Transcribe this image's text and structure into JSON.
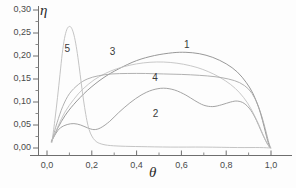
{
  "chart_data": {
    "type": "line",
    "title": "",
    "xlabel": "θ",
    "ylabel": "η",
    "xlim": [
      -0.03,
      1.08
    ],
    "ylim": [
      -0.012,
      0.315
    ],
    "grid": false,
    "legend": "inline-curve-numbers",
    "xticks": [
      0.0,
      0.2,
      0.4,
      0.6,
      0.8,
      1.0
    ],
    "xticklabels": [
      "0,0",
      "0,2",
      "0,4",
      "0,6",
      "0,8",
      "1,0"
    ],
    "xminorticks": [
      0.1,
      0.3,
      0.5,
      0.7,
      0.9
    ],
    "yticks": [
      0.0,
      0.05,
      0.1,
      0.15,
      0.2,
      0.25,
      0.3
    ],
    "yticklabels": [
      "0,00",
      "0,05",
      "0,10",
      "0,15",
      "0,20",
      "0,25",
      "0,30"
    ],
    "yminorticks": [
      0.025,
      0.075,
      0.125,
      0.175,
      0.225,
      0.275
    ],
    "series": [
      {
        "name": "1",
        "label": "1",
        "label_x": 0.625,
        "label_y": 0.222,
        "color": "#8c8c8c",
        "points": [
          [
            0.02,
            0.015
          ],
          [
            0.05,
            0.045
          ],
          [
            0.08,
            0.07
          ],
          [
            0.12,
            0.095
          ],
          [
            0.18,
            0.125
          ],
          [
            0.25,
            0.152
          ],
          [
            0.32,
            0.172
          ],
          [
            0.4,
            0.19
          ],
          [
            0.48,
            0.201
          ],
          [
            0.56,
            0.207
          ],
          [
            0.62,
            0.208
          ],
          [
            0.68,
            0.205
          ],
          [
            0.74,
            0.197
          ],
          [
            0.8,
            0.183
          ],
          [
            0.85,
            0.165
          ],
          [
            0.89,
            0.142
          ],
          [
            0.92,
            0.118
          ],
          [
            0.945,
            0.088
          ],
          [
            0.962,
            0.06
          ],
          [
            0.975,
            0.035
          ],
          [
            0.985,
            0.016
          ],
          [
            0.995,
            0.002
          ]
        ]
      },
      {
        "name": "2",
        "label": "2",
        "label_x": 0.485,
        "label_y": 0.072,
        "color": "#9a9a9a",
        "points": [
          [
            0.02,
            0.014
          ],
          [
            0.04,
            0.032
          ],
          [
            0.06,
            0.044
          ],
          [
            0.09,
            0.051
          ],
          [
            0.12,
            0.053
          ],
          [
            0.15,
            0.05
          ],
          [
            0.18,
            0.044
          ],
          [
            0.21,
            0.04
          ],
          [
            0.24,
            0.044
          ],
          [
            0.28,
            0.058
          ],
          [
            0.32,
            0.077
          ],
          [
            0.37,
            0.098
          ],
          [
            0.42,
            0.115
          ],
          [
            0.47,
            0.126
          ],
          [
            0.52,
            0.13
          ],
          [
            0.57,
            0.126
          ],
          [
            0.62,
            0.115
          ],
          [
            0.66,
            0.103
          ],
          [
            0.7,
            0.093
          ],
          [
            0.74,
            0.09
          ],
          [
            0.78,
            0.094
          ],
          [
            0.82,
            0.1
          ],
          [
            0.85,
            0.102
          ],
          [
            0.88,
            0.097
          ],
          [
            0.91,
            0.082
          ],
          [
            0.935,
            0.06
          ],
          [
            0.955,
            0.038
          ],
          [
            0.972,
            0.02
          ],
          [
            0.985,
            0.008
          ],
          [
            0.995,
            0.001
          ]
        ]
      },
      {
        "name": "3",
        "label": "3",
        "label_x": 0.293,
        "label_y": 0.207,
        "color": "#c2c2c2",
        "points": [
          [
            0.02,
            0.013
          ],
          [
            0.05,
            0.048
          ],
          [
            0.08,
            0.078
          ],
          [
            0.12,
            0.106
          ],
          [
            0.16,
            0.128
          ],
          [
            0.21,
            0.148
          ],
          [
            0.26,
            0.162
          ],
          [
            0.31,
            0.172
          ],
          [
            0.37,
            0.18
          ],
          [
            0.43,
            0.185
          ],
          [
            0.49,
            0.187
          ],
          [
            0.55,
            0.186
          ],
          [
            0.61,
            0.182
          ],
          [
            0.67,
            0.175
          ],
          [
            0.72,
            0.166
          ],
          [
            0.77,
            0.154
          ],
          [
            0.82,
            0.138
          ],
          [
            0.86,
            0.12
          ],
          [
            0.895,
            0.098
          ],
          [
            0.925,
            0.072
          ],
          [
            0.948,
            0.048
          ],
          [
            0.966,
            0.027
          ],
          [
            0.982,
            0.011
          ],
          [
            0.995,
            0.001
          ]
        ]
      },
      {
        "name": "4",
        "label": "4",
        "label_x": 0.483,
        "label_y": 0.15,
        "color": "#a8a8a8",
        "points": [
          [
            0.02,
            0.013
          ],
          [
            0.045,
            0.055
          ],
          [
            0.07,
            0.09
          ],
          [
            0.1,
            0.118
          ],
          [
            0.14,
            0.138
          ],
          [
            0.18,
            0.15
          ],
          [
            0.23,
            0.157
          ],
          [
            0.29,
            0.161
          ],
          [
            0.36,
            0.162
          ],
          [
            0.44,
            0.162
          ],
          [
            0.52,
            0.161
          ],
          [
            0.6,
            0.16
          ],
          [
            0.68,
            0.158
          ],
          [
            0.75,
            0.155
          ],
          [
            0.81,
            0.15
          ],
          [
            0.86,
            0.142
          ],
          [
            0.9,
            0.128
          ],
          [
            0.928,
            0.108
          ],
          [
            0.95,
            0.082
          ],
          [
            0.967,
            0.055
          ],
          [
            0.98,
            0.031
          ],
          [
            0.99,
            0.012
          ],
          [
            0.998,
            0.0
          ]
        ]
      },
      {
        "name": "5",
        "label": "5",
        "label_x": 0.092,
        "label_y": 0.212,
        "color": "#bdbdbd",
        "points": [
          [
            0.022,
            0.012
          ],
          [
            0.035,
            0.06
          ],
          [
            0.047,
            0.11
          ],
          [
            0.058,
            0.16
          ],
          [
            0.068,
            0.205
          ],
          [
            0.078,
            0.238
          ],
          [
            0.088,
            0.257
          ],
          [
            0.098,
            0.264
          ],
          [
            0.108,
            0.262
          ],
          [
            0.118,
            0.25
          ],
          [
            0.128,
            0.228
          ],
          [
            0.138,
            0.197
          ],
          [
            0.148,
            0.16
          ],
          [
            0.158,
            0.122
          ],
          [
            0.168,
            0.088
          ],
          [
            0.178,
            0.06
          ],
          [
            0.188,
            0.04
          ],
          [
            0.2,
            0.026
          ],
          [
            0.215,
            0.016
          ],
          [
            0.235,
            0.01
          ],
          [
            0.27,
            0.006
          ],
          [
            0.33,
            0.004
          ],
          [
            0.42,
            0.003
          ],
          [
            0.55,
            0.002
          ],
          [
            0.7,
            0.002
          ],
          [
            0.85,
            0.001
          ],
          [
            0.95,
            0.001
          ],
          [
            1.0,
            0.0
          ]
        ]
      }
    ]
  },
  "axes": {
    "y_axis_title": "η",
    "x_axis_title": "θ"
  }
}
